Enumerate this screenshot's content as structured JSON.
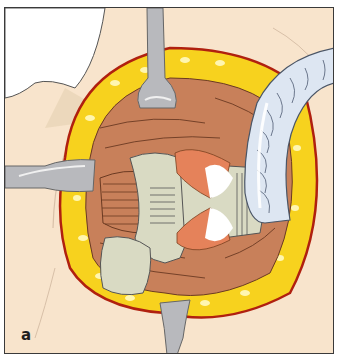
{
  "figure": {
    "panel_label": "a",
    "colors": {
      "skin": "#f8e4cc",
      "fat": "#f7d21e",
      "fat_highlight": "#fff6b0",
      "wound_edge": "#b0200f",
      "muscle": "#c8805a",
      "muscle_line": "#6b3a22",
      "tissue": "#d9dac3",
      "retractor": "#b8b9bd",
      "tube": "#dde6f2",
      "frame": "#3a3a3a"
    }
  }
}
